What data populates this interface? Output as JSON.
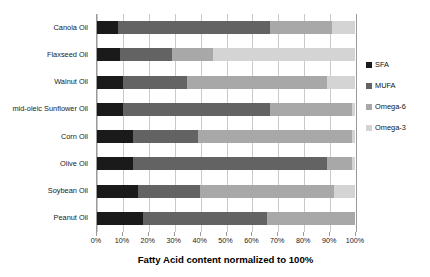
{
  "chart_data": {
    "type": "bar",
    "orientation": "horizontal",
    "stacked": true,
    "normalized": true,
    "title": "",
    "xlabel": "Fatty Acid content normalized to 100%",
    "ylabel": "",
    "xlim": [
      0,
      100
    ],
    "grid": true,
    "legend_position": "right",
    "xticks": [
      "0%",
      "10%",
      "20%",
      "30%",
      "40%",
      "50%",
      "60%",
      "70%",
      "80%",
      "90%",
      "100%"
    ],
    "xtick_values": [
      0,
      10,
      20,
      30,
      40,
      50,
      60,
      70,
      80,
      90,
      100
    ],
    "categories": [
      "Canola Oil",
      "Flaxseed Oil",
      "Walnut Oil",
      "mid-oleic Sunflower Oil",
      "Corn Oil",
      "Olive Oil",
      "Soybean Oil",
      "Peanut Oil"
    ],
    "series": [
      {
        "name": "SFA",
        "color": "#1a1a1a",
        "values": [
          8,
          9,
          10,
          10,
          14,
          14,
          16,
          18
        ]
      },
      {
        "name": "MUFA",
        "color": "#636363",
        "values": [
          59,
          20,
          25,
          57,
          25,
          75,
          24,
          48
        ]
      },
      {
        "name": "Omega-6",
        "color": "#a8a8a8",
        "values": [
          24,
          16,
          54,
          32,
          60,
          10,
          52,
          34
        ]
      },
      {
        "name": "Omega-3",
        "color": "#d4d4d4",
        "values": [
          9,
          55,
          11,
          1,
          1,
          1,
          8,
          0
        ]
      }
    ]
  },
  "legend": {
    "items": [
      {
        "label": "SFA",
        "color": "#1a1a1a"
      },
      {
        "label": "MUFA",
        "color": "#636363"
      },
      {
        "label": "Omega-6",
        "color": "#a8a8a8"
      },
      {
        "label": "Omega-3",
        "color": "#d4d4d4"
      }
    ]
  }
}
